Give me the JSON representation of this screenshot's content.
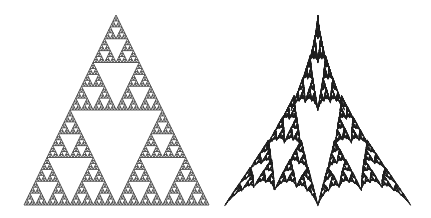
{
  "figure": {
    "background": "#ffffff",
    "panels": [
      {
        "name": "sierpinski-triangle",
        "type": "sierpinski",
        "apex": [
          116,
          15
        ],
        "base_left": [
          24,
          205
        ],
        "base_right": [
          209,
          205
        ],
        "depth": 6,
        "color": "#444444"
      },
      {
        "name": "distorted-sierpinski-fractal",
        "type": "distorted-ifs",
        "apex": [
          317,
          15
        ],
        "base_left": [
          224,
          206
        ],
        "base_right": [
          411,
          206
        ],
        "points": 60000,
        "color": "#222222"
      }
    ]
  }
}
